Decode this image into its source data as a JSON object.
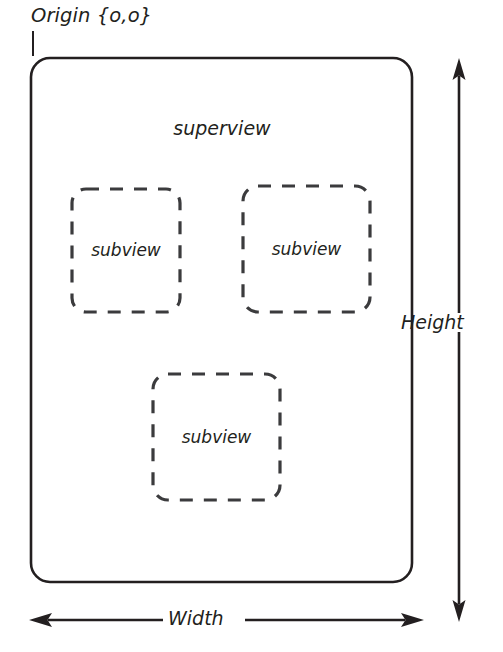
{
  "diagram": {
    "origin": {
      "label": "Origin {o,o}",
      "name": "origin-annotation"
    },
    "superview": {
      "label": "superview",
      "shape": "rounded-rectangle",
      "stroke": "#231f20",
      "fill": "#ffffff"
    },
    "subviews": [
      {
        "label": "subview",
        "shape": "dashed-rounded-rectangle"
      },
      {
        "label": "subview",
        "shape": "dashed-rounded-rectangle"
      },
      {
        "label": "subview",
        "shape": "dashed-rounded-rectangle"
      }
    ],
    "dimensions": {
      "height": {
        "label": "Height",
        "arrow": "double-headed-vertical-arrow"
      },
      "width": {
        "label": "Width",
        "arrow": "double-headed-horizontal-arrow"
      }
    },
    "colors": {
      "ink": "#231f20",
      "background": "#ffffff"
    }
  }
}
